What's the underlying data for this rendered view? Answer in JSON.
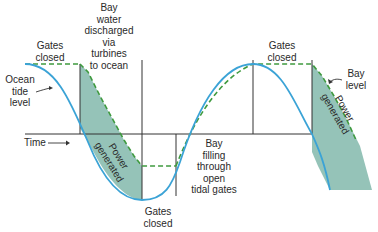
{
  "diagram": {
    "colors": {
      "tide_curve": "#3ba3d6",
      "bay_level": "#3f9a3f",
      "shade": "#8fc0b4",
      "axis": "#333333"
    },
    "labels": {
      "gates_closed_left": "Gates\nclosed",
      "bay_water_discharged": "Bay\nwater\ndischarged\nvia\nturbines\nto ocean",
      "ocean_tide_level": "Ocean\ntide\nlevel",
      "time": "Time",
      "power_generated_left": "Power\ngenerated",
      "gates_closed_bottom": "Gates\nclosed",
      "bay_filling": "Bay\nfilling\nthrough\nopen\ntidal gates",
      "gates_closed_right": "Gates\nclosed",
      "bay_level": "Bay\nlevel",
      "power_generated_right": "Power\ngenerated"
    }
  }
}
